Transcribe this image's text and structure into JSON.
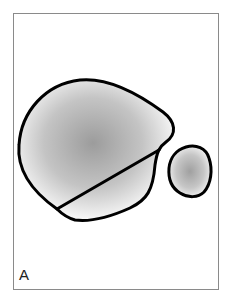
{
  "figure": {
    "panel_label": "A",
    "shapes": [
      {
        "name": "large-lobe",
        "fill_center": "#9c9c9c",
        "fill_edge": "#ffffff",
        "stroke": "#000000"
      },
      {
        "name": "small-lobe",
        "fill_center": "#a0a0a0",
        "fill_edge": "#ffffff",
        "stroke": "#000000"
      }
    ],
    "dividing_line": {
      "stroke": "#000000"
    },
    "frame_color": "#8a8a8a"
  }
}
